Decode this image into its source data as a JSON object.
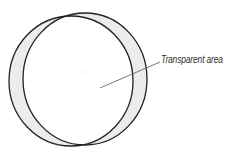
{
  "caption": {
    "top_text_clipped": ""
  },
  "diagram": {
    "circles": [
      {
        "name": "left-circle",
        "cx": 71,
        "cy": 81,
        "rx": 62,
        "ry": 65,
        "stroke": "#222222"
      },
      {
        "name": "right-circle",
        "cx": 85,
        "cy": 79,
        "rx": 62,
        "ry": 66,
        "stroke": "#222222"
      }
    ],
    "crescent_fill": "#ececec",
    "center_dot": {
      "x": 83,
      "y": 72
    },
    "leader_line": {
      "x1": 100,
      "y1": 88,
      "x2": 160,
      "y2": 62,
      "stroke": "#666666"
    },
    "annotation": "Transparent area"
  }
}
